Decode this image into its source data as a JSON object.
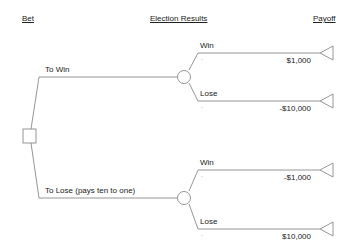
{
  "headers": {
    "bet": "Bet",
    "election_results": "Election Results",
    "payoff": "Payoff"
  },
  "decision": {
    "branches": [
      {
        "label": "To Win",
        "outcomes": [
          {
            "label": "Win",
            "probability": ".",
            "payoff": "$1,000"
          },
          {
            "label": "Lose",
            "probability": ".",
            "payoff": "-$10,000"
          }
        ]
      },
      {
        "label": "To Lose (pays ten to one)",
        "outcomes": [
          {
            "label": "Win",
            "probability": ".",
            "payoff": "-$1,000"
          },
          {
            "label": "Lose",
            "probability": ".",
            "payoff": "$10,000"
          }
        ]
      }
    ]
  },
  "colors": {
    "line": "#8a8a8a",
    "text": "#222222",
    "background": "#ffffff"
  }
}
